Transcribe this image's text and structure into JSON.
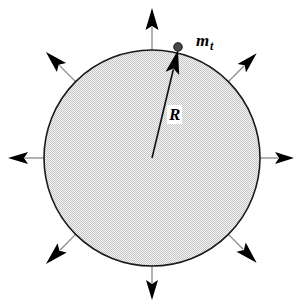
{
  "figure": {
    "type": "physics-diagram",
    "width": 302,
    "height": 305,
    "background_color": "#ffffff"
  },
  "labels": {
    "point_mass": {
      "base": "m",
      "subscript": "t",
      "full": "m_t",
      "x": 196,
      "y": 32
    },
    "radius": {
      "text": "R",
      "x": 167,
      "y": 105
    }
  },
  "sphere": {
    "name": "stippled-sphere",
    "center_x": 152,
    "center_y": 158,
    "radius": 108,
    "outline_color": "#1a1a1a",
    "outline_width": 1.6,
    "fill_color": "#efefef",
    "stipple_color": "#b4b4b4",
    "stipple_spacing": 2
  },
  "radius_vector": {
    "name": "radius-vector",
    "from_x": 152,
    "from_y": 158,
    "to_x": 178,
    "to_y": 50,
    "color": "#111111",
    "width": 1.6,
    "angle_deg": 76
  },
  "point_mass_dot": {
    "name": "point-mass-dot",
    "x": 178,
    "y": 47,
    "radius": 4.2,
    "color": "#4a4a4a",
    "edge_color": "#151515"
  },
  "field_arrows": {
    "count": 8,
    "shaft_color": "#8a8a8a",
    "head_color": "#000000",
    "items": [
      {
        "name": "arrow-up",
        "angle_deg": 270,
        "length": 42,
        "head_len": 22,
        "head_w": 13
      },
      {
        "name": "arrow-upper-right",
        "angle_deg": 315,
        "length": 40,
        "head_len": 21,
        "head_w": 12
      },
      {
        "name": "arrow-right",
        "angle_deg": 0,
        "length": 34,
        "head_len": 19,
        "head_w": 12
      },
      {
        "name": "arrow-lower-right",
        "angle_deg": 45,
        "length": 40,
        "head_len": 22,
        "head_w": 13
      },
      {
        "name": "arrow-down",
        "angle_deg": 90,
        "length": 34,
        "head_len": 20,
        "head_w": 12
      },
      {
        "name": "arrow-lower-left",
        "angle_deg": 135,
        "length": 42,
        "head_len": 23,
        "head_w": 13
      },
      {
        "name": "arrow-left",
        "angle_deg": 180,
        "length": 36,
        "head_len": 20,
        "head_w": 12
      },
      {
        "name": "arrow-upper-left",
        "angle_deg": 225,
        "length": 42,
        "head_len": 22,
        "head_w": 13
      }
    ]
  }
}
